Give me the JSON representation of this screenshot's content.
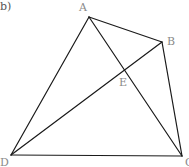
{
  "figure": {
    "label": "b)"
  },
  "points": {
    "A": {
      "label": "A",
      "x": 89,
      "y": 17,
      "label_x": 79,
      "label_y": 11
    },
    "B": {
      "label": "B",
      "x": 162,
      "y": 42,
      "label_x": 167,
      "label_y": 45
    },
    "C": {
      "label": "C",
      "x": 182,
      "y": 156,
      "label_x": 185,
      "label_y": 166
    },
    "D": {
      "label": "D",
      "x": 11,
      "y": 155,
      "label_x": 0,
      "label_y": 166
    },
    "E": {
      "label": "E",
      "x": 125,
      "y": 70,
      "label_x": 119,
      "label_y": 86
    }
  },
  "segments": [
    {
      "from": "A",
      "to": "B"
    },
    {
      "from": "B",
      "to": "C"
    },
    {
      "from": "C",
      "to": "D"
    },
    {
      "from": "D",
      "to": "A"
    },
    {
      "from": "A",
      "to": "C"
    },
    {
      "from": "D",
      "to": "B"
    }
  ],
  "colors": {
    "line": "#1a1a1a",
    "label": "#8a8a8a"
  }
}
